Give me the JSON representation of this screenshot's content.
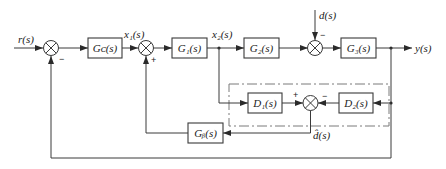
{
  "diagram": {
    "type": "control-system-block-diagram",
    "signals": {
      "input": "r(s)",
      "x1": "x₁(s)",
      "x2": "x₂(s)",
      "disturbance": "d(s)",
      "output": "y(s)",
      "estimate": "d̂(s)"
    },
    "blocks": {
      "gc": "Gᴄ(s)",
      "g1": "G₁(s)",
      "g2": "G₂(s)",
      "g3": "G₃(s)",
      "d1": "D₁(s)",
      "d2": "D₂(s)",
      "gb": "Gᵦ(s)"
    },
    "signs": {
      "sum1_feedback": "−",
      "sum2_feedback": "+",
      "sum3_disturbance": "−",
      "sum4_d1": "+",
      "sum4_d2": "−"
    },
    "observer_box": "dash-dot boundary enclosing D1, D2 and summing junction"
  }
}
